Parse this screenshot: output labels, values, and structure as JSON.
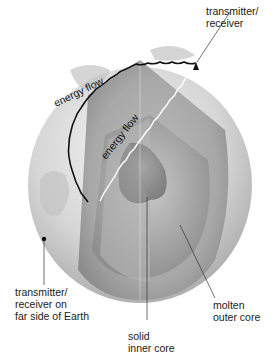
{
  "figure": {
    "labels": {
      "top_transmitter": "transmitter/\nreceiver",
      "far_transmitter": "transmitter/\nreceiver on\nfar side of Earth",
      "inner_core": "solid\ninner core",
      "outer_core": "molten\nouter core",
      "energy_flow_surface": "energy flow",
      "energy_flow_through": "energy flow"
    },
    "layers": [
      {
        "name": "crust-mantle",
        "color": "#cfcfcf"
      },
      {
        "name": "outer-core",
        "color": "#9a9a9a"
      },
      {
        "name": "inner-core",
        "color": "#8a8a8a"
      }
    ]
  }
}
